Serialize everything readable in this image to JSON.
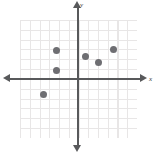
{
  "figure": {
    "title": "",
    "background_color": "#ffffff",
    "width": 157,
    "height": 154
  },
  "axes": {
    "x_label": "x",
    "y_label": "y",
    "axis_color": "#58595b",
    "grid_color": "#e8e6e6",
    "origin_px": {
      "x": 78,
      "y": 79
    },
    "grid_cell_px": 9.8,
    "arrow_x_right": "arrow-right",
    "arrow_x_left": "arrow-left",
    "arrow_y_up": "arrow-up",
    "arrow_y_down": "arrow-down"
  },
  "chart_data": {
    "type": "scatter",
    "title": "",
    "xlabel": "x",
    "ylabel": "y",
    "grid": true,
    "legend": null,
    "xlim": [
      -6,
      6
    ],
    "ylim": [
      -6,
      6
    ],
    "xticks": [],
    "yticks": [],
    "point_color": "#6e6e72",
    "point_radius_px": 3.5,
    "points": [
      {
        "x": -2.3,
        "y": 3.0,
        "px": 56,
        "py": 50
      },
      {
        "x": -2.3,
        "y": 0.9,
        "px": 56,
        "py": 70
      },
      {
        "x": -3.6,
        "y": -1.5,
        "px": 43,
        "py": 94
      },
      {
        "x": 0.7,
        "y": 2.4,
        "px": 85,
        "py": 56
      },
      {
        "x": 2.1,
        "y": 1.8,
        "px": 98,
        "py": 62
      },
      {
        "x": 3.6,
        "y": 3.1,
        "px": 113,
        "py": 49
      }
    ]
  }
}
